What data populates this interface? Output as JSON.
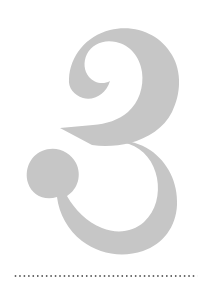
{
  "page": {
    "background_color": "#ffffff",
    "width": 202,
    "height": 298,
    "kind": "book-chapter-opener"
  },
  "numeral": {
    "value": "3",
    "aria_label": "Chapter 3",
    "style": "didone-ball-terminal",
    "fill_color": "#c6c6c6",
    "bounds": {
      "x": 26,
      "y": 28,
      "width": 154,
      "height": 224
    }
  },
  "divider": {
    "name": "dotted-rule",
    "dot_color": "#3a3a3a",
    "dot_size": 1.5,
    "dot_spacing": 4.45,
    "dot_count": 42,
    "x_start": 14,
    "x_end": 198,
    "y": 277
  }
}
